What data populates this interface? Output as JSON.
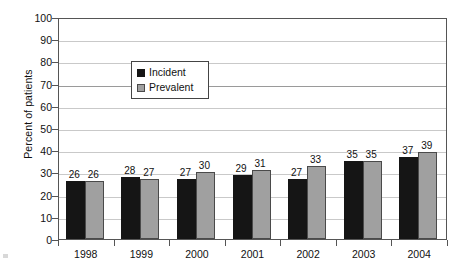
{
  "chart_data": {
    "type": "bar",
    "title": "",
    "xlabel": "",
    "ylabel": "Percent of patients",
    "ylim": [
      0,
      100
    ],
    "ytick_step": 10,
    "yticks": [
      100,
      90,
      80,
      70,
      60,
      50,
      40,
      30,
      20,
      10,
      0
    ],
    "grid": true,
    "legend_position": "inside-top-center",
    "categories": [
      "1998",
      "1999",
      "2000",
      "2001",
      "2002",
      "2003",
      "2004"
    ],
    "series": [
      {
        "name": "Incident",
        "color": "#151515",
        "values": [
          26,
          28,
          27,
          29,
          27,
          35,
          37
        ]
      },
      {
        "name": "Prevalent",
        "color": "#a0a0a0",
        "values": [
          26,
          27,
          30,
          31,
          33,
          35,
          39
        ]
      }
    ]
  },
  "legend": {
    "items": [
      {
        "label": "Incident",
        "swatch": "incident"
      },
      {
        "label": "Prevalent",
        "swatch": "prevalent"
      }
    ]
  },
  "colors": {
    "incident": "#151515",
    "prevalent": "#a0a0a0",
    "axis": "#555555",
    "gridline": "#c9c9c9",
    "text": "#111111",
    "background": "#ffffff"
  }
}
